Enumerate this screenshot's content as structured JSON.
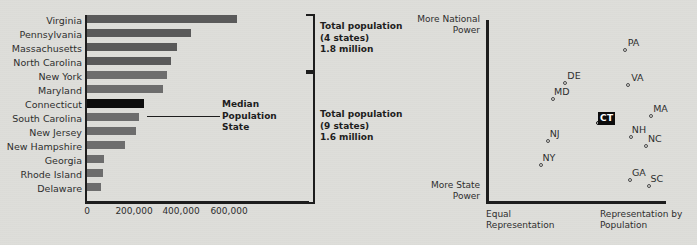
{
  "bar_chart": {
    "highlight_state": "Connecticut",
    "median_callout": [
      "Median",
      "Population",
      "State"
    ],
    "annotations": [
      {
        "lines": [
          "Total population",
          "(4 states)",
          "1.8 million"
        ],
        "group": "top-4"
      },
      {
        "lines": [
          "Total population",
          "(9 states)",
          "1.6 million"
        ],
        "group": "bottom-9"
      }
    ],
    "axis_ticks": [
      "0",
      "200,000",
      "400,000",
      "600,000"
    ]
  },
  "scatter": {
    "y_axis_top_label": [
      "More National",
      "Power"
    ],
    "y_axis_bottom_label": [
      "More State",
      "Power"
    ],
    "x_axis_left_label": [
      "Equal",
      "Representation"
    ],
    "x_axis_right_label": [
      "Representation by",
      "Population"
    ],
    "highlight_point": "CT"
  },
  "chart_data": [
    {
      "type": "bar",
      "orientation": "horizontal",
      "title": "State populations at the Constitutional Convention",
      "xlabel": "",
      "ylabel": "",
      "xlim": [
        0,
        670000
      ],
      "grid": false,
      "categories": [
        "Virginia",
        "Pennsylvania",
        "Massachusetts",
        "North Carolina",
        "New York",
        "Maryland",
        "Connecticut",
        "South Carolina",
        "New Jersey",
        "New Hampshire",
        "Georgia",
        "Rhode Island",
        "Delaware"
      ],
      "values": [
        632000,
        440000,
        379000,
        354000,
        340000,
        320000,
        240000,
        220000,
        205000,
        160000,
        71000,
        69000,
        59000
      ],
      "tick_values": [
        0,
        200000,
        400000,
        600000
      ],
      "tick_labels": [
        "0",
        "200,000",
        "400,000",
        "600,000"
      ],
      "highlighted_category": "Connecticut",
      "annotations": [
        {
          "text": "Total population (4 states) 1.8 million",
          "covers": [
            "Virginia",
            "Pennsylvania",
            "Massachusetts",
            "North Carolina"
          ]
        },
        {
          "text": "Total population (9 states) 1.6 million",
          "covers": [
            "New York",
            "Maryland",
            "Connecticut",
            "South Carolina",
            "New Jersey",
            "New Hampshire",
            "Georgia",
            "Rhode Island",
            "Delaware"
          ]
        },
        {
          "text": "Median Population State",
          "covers": [
            "Connecticut"
          ]
        }
      ]
    },
    {
      "type": "scatter",
      "title": "State positions on representation and power",
      "xlabel": "Equal Representation → Representation by Population",
      "ylabel": "More State Power → More National Power",
      "xlim": [
        0,
        1
      ],
      "ylim": [
        0,
        1
      ],
      "grid": false,
      "legend": "none",
      "points": [
        {
          "label": "PA",
          "x": 0.755,
          "y": 0.855,
          "label_pos": "top-right"
        },
        {
          "label": "DE",
          "x": 0.42,
          "y": 0.67,
          "label_pos": "top-right"
        },
        {
          "label": "MD",
          "x": 0.35,
          "y": 0.58,
          "label_pos": "top-right"
        },
        {
          "label": "VA",
          "x": 0.775,
          "y": 0.66,
          "label_pos": "top-right"
        },
        {
          "label": "MA",
          "x": 0.905,
          "y": 0.485,
          "label_pos": "top-right"
        },
        {
          "label": "CT",
          "x": 0.605,
          "y": 0.445,
          "label_pos": "top-right",
          "highlighted": true
        },
        {
          "label": "NH",
          "x": 0.79,
          "y": 0.37,
          "label_pos": "top-right"
        },
        {
          "label": "NC",
          "x": 0.875,
          "y": 0.32,
          "label_pos": "top-right"
        },
        {
          "label": "NJ",
          "x": 0.32,
          "y": 0.348,
          "label_pos": "top-right"
        },
        {
          "label": "NY",
          "x": 0.285,
          "y": 0.215,
          "label_pos": "top-right"
        },
        {
          "label": "GA",
          "x": 0.785,
          "y": 0.13,
          "label_pos": "top-right"
        },
        {
          "label": "SC",
          "x": 0.89,
          "y": 0.095,
          "label_pos": "top-right"
        }
      ]
    }
  ]
}
